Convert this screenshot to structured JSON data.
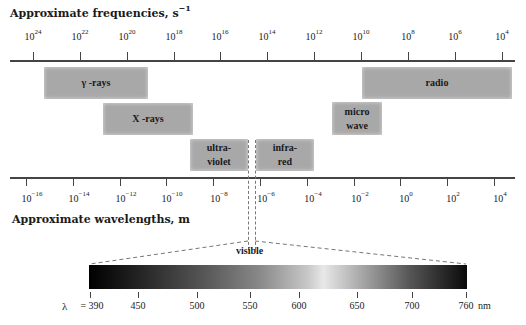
{
  "frequency_axis": {
    "title": "Approximate frequencies, s",
    "title_exponent": "−1",
    "ticks": [
      {
        "base": "10",
        "exp": "24",
        "x": 33
      },
      {
        "base": "10",
        "exp": "22",
        "x": 80
      },
      {
        "base": "10",
        "exp": "20",
        "x": 127
      },
      {
        "base": "10",
        "exp": "18",
        "x": 174
      },
      {
        "base": "10",
        "exp": "16",
        "x": 220
      },
      {
        "base": "10",
        "exp": "14",
        "x": 267
      },
      {
        "base": "10",
        "exp": "12",
        "x": 314
      },
      {
        "base": "10",
        "exp": "10",
        "x": 361
      },
      {
        "base": "10",
        "exp": "8",
        "x": 408
      },
      {
        "base": "10",
        "exp": "6",
        "x": 455
      },
      {
        "base": "10",
        "exp": "4",
        "x": 502
      }
    ]
  },
  "wavelength_axis": {
    "title": "Approximate wavelengths, m",
    "ticks": [
      {
        "base": "10",
        "exp": "−16",
        "x": 26
      },
      {
        "base": "10",
        "exp": "−14",
        "x": 73
      },
      {
        "base": "10",
        "exp": "−12",
        "x": 120
      },
      {
        "base": "10",
        "exp": "−10",
        "x": 166
      },
      {
        "base": "10",
        "exp": "−8",
        "x": 213
      },
      {
        "base": "10",
        "exp": "−6",
        "x": 260
      },
      {
        "base": "10",
        "exp": "−4",
        "x": 307
      },
      {
        "base": "10",
        "exp": "−2",
        "x": 354
      },
      {
        "base": "10",
        "exp": "0",
        "x": 400
      },
      {
        "base": "10",
        "exp": "2",
        "x": 447
      },
      {
        "base": "10",
        "exp": "4",
        "x": 494
      }
    ]
  },
  "bands": {
    "gamma": {
      "line1": "γ -rays",
      "line2": ""
    },
    "xray": {
      "line1": "X -rays",
      "line2": ""
    },
    "ultraviolet": {
      "line1": "ultra-",
      "line2": "violet"
    },
    "infrared": {
      "line1": "infra-",
      "line2": "red"
    },
    "microwave": {
      "line1": "micro",
      "line2": "wave"
    },
    "radio": {
      "line1": "radio",
      "line2": ""
    }
  },
  "visible": {
    "label": "visible",
    "wavelength_prefix": "λ",
    "unit": "nm",
    "ticks": [
      {
        "label": "= 390",
        "x": 90
      },
      {
        "label": "450",
        "x": 138
      },
      {
        "label": "500",
        "x": 197
      },
      {
        "label": "550",
        "x": 250
      },
      {
        "label": "600",
        "x": 299
      },
      {
        "label": "650",
        "x": 357
      },
      {
        "label": "700",
        "x": 412
      },
      {
        "label": "760",
        "x": 466
      }
    ]
  }
}
